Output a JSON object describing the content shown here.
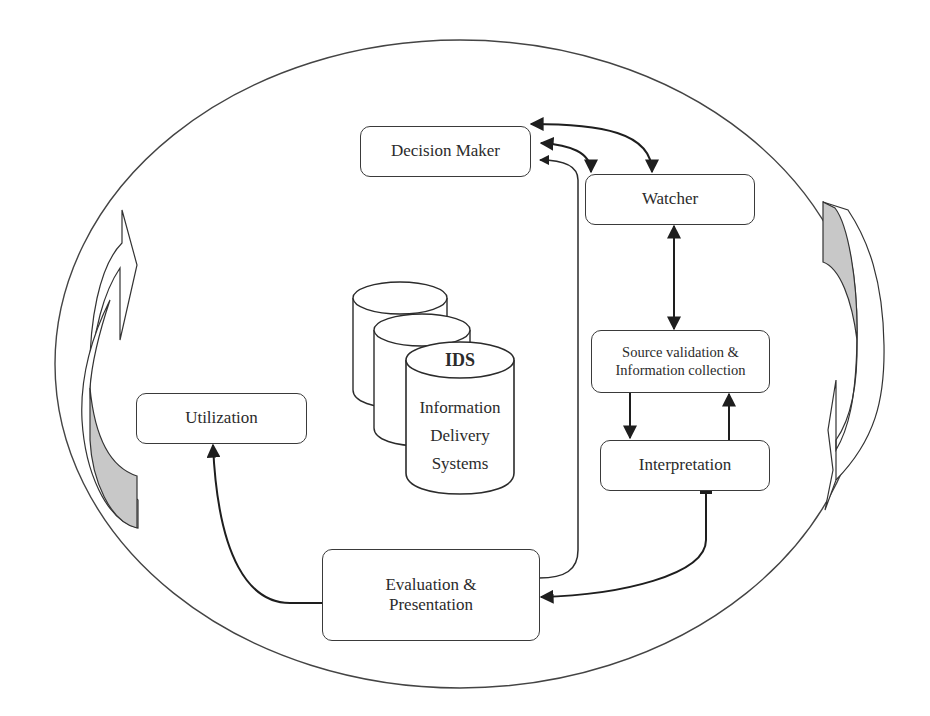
{
  "diagram": {
    "type": "process-cycle",
    "nodes": {
      "decision_maker": {
        "label": "Decision Maker"
      },
      "watcher": {
        "label": "Watcher"
      },
      "source_validation": {
        "line1": "Source validation &",
        "line2": "Information collection"
      },
      "interpretation": {
        "label": "Interpretation"
      },
      "evaluation": {
        "line1": "Evaluation &",
        "line2": "Presentation"
      },
      "utilization": {
        "label": "Utilization"
      },
      "ids": {
        "title": "IDS",
        "line1": "Information",
        "line2": "Delivery",
        "line3": "Systems"
      }
    },
    "edges": [
      {
        "from": "decision_maker",
        "to": "watcher",
        "direction": "bidirectional"
      },
      {
        "from": "decision_maker",
        "to": "watcher",
        "direction": "bidirectional"
      },
      {
        "from": "evaluation",
        "to": "decision_maker",
        "direction": "forward"
      },
      {
        "from": "watcher",
        "to": "source_validation",
        "direction": "bidirectional"
      },
      {
        "from": "source_validation",
        "to": "interpretation",
        "direction": "forward"
      },
      {
        "from": "interpretation",
        "to": "source_validation",
        "direction": "forward"
      },
      {
        "from": "interpretation",
        "to": "evaluation",
        "direction": "forward"
      },
      {
        "from": "evaluation",
        "to": "utilization",
        "direction": "forward"
      }
    ],
    "decorations": {
      "outer_ellipse": true,
      "left_cycle_arrow": "upward",
      "right_cycle_arrow": "downward",
      "cycle_arrow_fill": "#c8c8c8"
    },
    "colors": {
      "stroke": "#2b2b2b",
      "shade": "#c8c8c8",
      "background": "#ffffff"
    }
  }
}
